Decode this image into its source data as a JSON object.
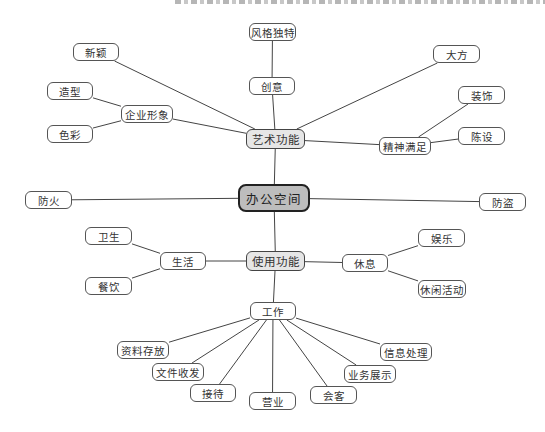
{
  "diagram": {
    "type": "mind-map",
    "root": {
      "id": "root",
      "label": "办公空间"
    },
    "colors": {
      "root_fill": "#bdbdbd",
      "level1_fill": "#e6e6e6",
      "leaf_fill": "#ffffff",
      "line": "#444444"
    },
    "nodes": [
      {
        "id": "root",
        "label": "办公空间",
        "level": "root",
        "x": 238,
        "y": 184,
        "w": 72,
        "h": 28
      },
      {
        "id": "art",
        "label": "艺术功能",
        "level": "level1",
        "x": 246,
        "y": 129,
        "w": 59,
        "h": 20
      },
      {
        "id": "use",
        "label": "使用功能",
        "level": "level1",
        "x": 246,
        "y": 251,
        "w": 59,
        "h": 20
      },
      {
        "id": "fire",
        "label": "防火",
        "level": "leaf",
        "x": 25,
        "y": 191,
        "w": 47,
        "h": 18
      },
      {
        "id": "theft",
        "label": "防盗",
        "level": "leaf",
        "x": 479,
        "y": 193,
        "w": 47,
        "h": 18
      },
      {
        "id": "creative",
        "label": "创意",
        "level": "leaf",
        "x": 249,
        "y": 77,
        "w": 46,
        "h": 18
      },
      {
        "id": "unique",
        "label": "风格独特",
        "level": "leaf",
        "x": 249,
        "y": 23,
        "w": 47,
        "h": 18
      },
      {
        "id": "novel",
        "label": "新颖",
        "level": "leaf",
        "x": 73,
        "y": 43,
        "w": 46,
        "h": 18
      },
      {
        "id": "image",
        "label": "企业形象",
        "level": "leaf",
        "x": 121,
        "y": 105,
        "w": 52,
        "h": 18
      },
      {
        "id": "shape",
        "label": "造型",
        "level": "leaf",
        "x": 47,
        "y": 82,
        "w": 46,
        "h": 18
      },
      {
        "id": "color",
        "label": "色彩",
        "level": "leaf",
        "x": 47,
        "y": 125,
        "w": 46,
        "h": 18
      },
      {
        "id": "generous",
        "label": "大方",
        "level": "leaf",
        "x": 433,
        "y": 45,
        "w": 47,
        "h": 18
      },
      {
        "id": "spirit",
        "label": "精神满足",
        "level": "leaf",
        "x": 379,
        "y": 137,
        "w": 52,
        "h": 18
      },
      {
        "id": "decor",
        "label": "装饰",
        "level": "leaf",
        "x": 458,
        "y": 86,
        "w": 47,
        "h": 18
      },
      {
        "id": "furnish",
        "label": "陈设",
        "level": "leaf",
        "x": 458,
        "y": 127,
        "w": 47,
        "h": 18
      },
      {
        "id": "life",
        "label": "生活",
        "level": "leaf",
        "x": 160,
        "y": 252,
        "w": 46,
        "h": 18
      },
      {
        "id": "hygiene",
        "label": "卫生",
        "level": "leaf",
        "x": 85,
        "y": 227,
        "w": 47,
        "h": 18
      },
      {
        "id": "dining",
        "label": "餐饮",
        "level": "leaf",
        "x": 85,
        "y": 277,
        "w": 47,
        "h": 18
      },
      {
        "id": "rest",
        "label": "休息",
        "level": "leaf",
        "x": 342,
        "y": 254,
        "w": 46,
        "h": 18
      },
      {
        "id": "fun",
        "label": "娱乐",
        "level": "leaf",
        "x": 418,
        "y": 229,
        "w": 47,
        "h": 18
      },
      {
        "id": "leisure",
        "label": "休闲活动",
        "level": "leaf",
        "x": 418,
        "y": 280,
        "w": 48,
        "h": 18
      },
      {
        "id": "work",
        "label": "工作",
        "level": "leaf",
        "x": 250,
        "y": 302,
        "w": 46,
        "h": 18
      },
      {
        "id": "archive",
        "label": "资料存放",
        "level": "leaf",
        "x": 117,
        "y": 341,
        "w": 52,
        "h": 18
      },
      {
        "id": "docs",
        "label": "文件收发",
        "level": "leaf",
        "x": 152,
        "y": 363,
        "w": 52,
        "h": 18
      },
      {
        "id": "reception",
        "label": "接待",
        "level": "leaf",
        "x": 190,
        "y": 384,
        "w": 46,
        "h": 18
      },
      {
        "id": "business",
        "label": "营业",
        "level": "leaf",
        "x": 249,
        "y": 392,
        "w": 47,
        "h": 18
      },
      {
        "id": "guests",
        "label": "会客",
        "level": "leaf",
        "x": 310,
        "y": 386,
        "w": 47,
        "h": 18
      },
      {
        "id": "showcase",
        "label": "业务展示",
        "level": "leaf",
        "x": 344,
        "y": 365,
        "w": 52,
        "h": 18
      },
      {
        "id": "info",
        "label": "信息处理",
        "level": "leaf",
        "x": 380,
        "y": 343,
        "w": 52,
        "h": 18
      }
    ],
    "edges": [
      [
        "root",
        "art"
      ],
      [
        "root",
        "use"
      ],
      [
        "root",
        "fire"
      ],
      [
        "root",
        "theft"
      ],
      [
        "art",
        "creative"
      ],
      [
        "creative",
        "unique"
      ],
      [
        "art",
        "novel"
      ],
      [
        "art",
        "image"
      ],
      [
        "image",
        "shape"
      ],
      [
        "image",
        "color"
      ],
      [
        "art",
        "generous"
      ],
      [
        "art",
        "spirit"
      ],
      [
        "spirit",
        "decor"
      ],
      [
        "spirit",
        "furnish"
      ],
      [
        "use",
        "life"
      ],
      [
        "life",
        "hygiene"
      ],
      [
        "life",
        "dining"
      ],
      [
        "use",
        "rest"
      ],
      [
        "rest",
        "fun"
      ],
      [
        "rest",
        "leisure"
      ],
      [
        "use",
        "work"
      ],
      [
        "work",
        "archive"
      ],
      [
        "work",
        "docs"
      ],
      [
        "work",
        "reception"
      ],
      [
        "work",
        "business"
      ],
      [
        "work",
        "guests"
      ],
      [
        "work",
        "showcase"
      ],
      [
        "work",
        "info"
      ]
    ]
  }
}
